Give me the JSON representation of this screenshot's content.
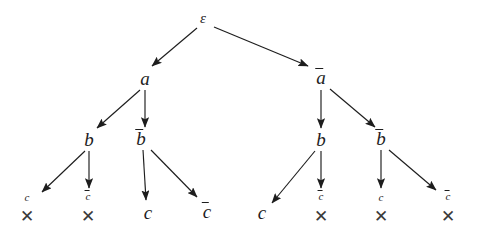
{
  "diagram": {
    "background_color": "#ffffff",
    "stroke_color": "#1d1d1d",
    "cross_symbol": "✕",
    "nodes": [
      {
        "id": "root",
        "label": "ε",
        "overline": false,
        "size": "root",
        "x": 203,
        "y": 18
      },
      {
        "id": "a",
        "label": "a",
        "overline": false,
        "size": "big",
        "x": 145,
        "y": 78
      },
      {
        "id": "abar",
        "label": "a",
        "overline": true,
        "size": "big",
        "x": 321,
        "y": 77
      },
      {
        "id": "b1",
        "label": "b",
        "overline": false,
        "size": "big",
        "x": 89,
        "y": 139
      },
      {
        "id": "b2",
        "label": "b",
        "overline": true,
        "size": "big",
        "x": 141,
        "y": 138
      },
      {
        "id": "b3",
        "label": "b",
        "overline": false,
        "size": "big",
        "x": 321,
        "y": 139
      },
      {
        "id": "b4",
        "label": "b",
        "overline": true,
        "size": "big",
        "x": 381,
        "y": 138
      },
      {
        "id": "c1",
        "label": "c",
        "overline": false,
        "size": "small",
        "x": 27,
        "y": 197,
        "cross": true,
        "cross_x": 27,
        "cross_y": 216
      },
      {
        "id": "c2",
        "label": "c",
        "overline": true,
        "size": "small",
        "x": 88,
        "y": 196,
        "cross": true,
        "cross_x": 88,
        "cross_y": 216
      },
      {
        "id": "c3",
        "label": "c",
        "overline": false,
        "size": "big",
        "x": 148,
        "y": 212,
        "cross": false
      },
      {
        "id": "c4",
        "label": "c",
        "overline": true,
        "size": "big",
        "x": 207,
        "y": 211,
        "cross": false
      },
      {
        "id": "c5",
        "label": "c",
        "overline": false,
        "size": "big",
        "x": 262,
        "y": 212,
        "cross": false
      },
      {
        "id": "c6",
        "label": "c",
        "overline": true,
        "size": "small",
        "x": 321,
        "y": 196,
        "cross": true,
        "cross_x": 321,
        "cross_y": 216
      },
      {
        "id": "c7",
        "label": "c",
        "overline": false,
        "size": "small",
        "x": 381,
        "y": 197,
        "cross": true,
        "cross_x": 381,
        "cross_y": 216
      },
      {
        "id": "c8",
        "label": "c",
        "overline": true,
        "size": "small",
        "x": 448,
        "y": 196,
        "cross": true,
        "cross_x": 448,
        "cross_y": 216
      }
    ],
    "edges": [
      {
        "id": "e-root-a",
        "from": "root",
        "to": "a",
        "x1": 197,
        "y1": 28,
        "x2": 152,
        "y2": 66
      },
      {
        "id": "e-root-abar",
        "from": "root",
        "to": "abar",
        "x1": 214,
        "y1": 27,
        "x2": 308,
        "y2": 66
      },
      {
        "id": "e-a-b1",
        "from": "a",
        "to": "b1",
        "x1": 140,
        "y1": 90,
        "x2": 97,
        "y2": 128
      },
      {
        "id": "e-a-b2",
        "from": "a",
        "to": "b2",
        "x1": 145,
        "y1": 90,
        "x2": 145,
        "y2": 127
      },
      {
        "id": "e-abar-b3",
        "from": "abar",
        "to": "b3",
        "x1": 321,
        "y1": 90,
        "x2": 321,
        "y2": 128
      },
      {
        "id": "e-abar-b4",
        "from": "abar",
        "to": "b4",
        "x1": 330,
        "y1": 89,
        "x2": 375,
        "y2": 127
      },
      {
        "id": "e-b1-c1",
        "from": "b1",
        "to": "c1",
        "x1": 85,
        "y1": 151,
        "x2": 42,
        "y2": 192
      },
      {
        "id": "e-b1-c2",
        "from": "b1",
        "to": "c2",
        "x1": 89,
        "y1": 151,
        "x2": 89,
        "y2": 188
      },
      {
        "id": "e-b2-c3",
        "from": "b2",
        "to": "c3",
        "x1": 143,
        "y1": 150,
        "x2": 146,
        "y2": 200
      },
      {
        "id": "e-b2-c4",
        "from": "b2",
        "to": "c4",
        "x1": 151,
        "y1": 150,
        "x2": 197,
        "y2": 197
      },
      {
        "id": "e-b3-c5",
        "from": "b3",
        "to": "c5",
        "x1": 315,
        "y1": 151,
        "x2": 272,
        "y2": 203
      },
      {
        "id": "e-b3-c6",
        "from": "b3",
        "to": "c6",
        "x1": 321,
        "y1": 151,
        "x2": 321,
        "y2": 188
      },
      {
        "id": "e-b4-c7",
        "from": "b4",
        "to": "c7",
        "x1": 381,
        "y1": 150,
        "x2": 381,
        "y2": 188
      },
      {
        "id": "e-b4-c8",
        "from": "b4",
        "to": "c8",
        "x1": 389,
        "y1": 150,
        "x2": 436,
        "y2": 190
      }
    ]
  }
}
